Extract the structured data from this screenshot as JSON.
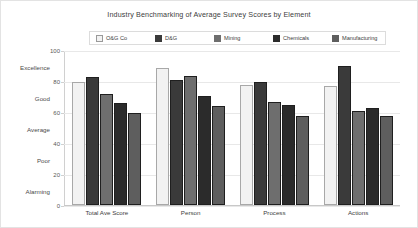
{
  "chart_data": {
    "type": "bar",
    "title": "Industry Benchmarking of Average Survey Scores by Element",
    "xlabel": "",
    "ylabel": "",
    "ylim": [
      0,
      100
    ],
    "yticks": [
      0,
      20,
      40,
      60,
      80,
      100
    ],
    "grid": true,
    "legend_position": "top",
    "band_labels": [
      "Excellence",
      "Good",
      "Average",
      "Poor",
      "Alarming"
    ],
    "categories": [
      "Total Ave Score",
      "Person",
      "Process",
      "Actions"
    ],
    "series": [
      {
        "name": "O&G Co",
        "color": "#f2f2f2",
        "values": [
          80,
          89,
          78,
          77
        ]
      },
      {
        "name": "D&G",
        "color": "#3a3a3a",
        "values": [
          83,
          81,
          80,
          90
        ]
      },
      {
        "name": "Mining",
        "color": "#6e6e6e",
        "values": [
          72,
          84,
          67,
          61
        ]
      },
      {
        "name": "Chemicals",
        "color": "#2b2b2b",
        "values": [
          66,
          71,
          65,
          63
        ]
      },
      {
        "name": "Manufacturing",
        "color": "#5e5e5e",
        "values": [
          60,
          64,
          58,
          58
        ]
      }
    ]
  }
}
